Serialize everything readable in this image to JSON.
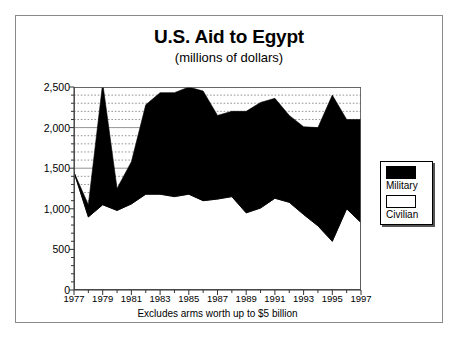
{
  "chart_data": {
    "type": "area",
    "title": "U.S. Aid to Egypt",
    "subtitle": "(millions of dollars)",
    "xlabel": "",
    "ylabel": "",
    "footnote": "Excludes arms worth up to $5 billion",
    "stacked": true,
    "grid": true,
    "legend_position": "right",
    "xlim": [
      1977,
      1997
    ],
    "ylim": [
      0,
      2500
    ],
    "ytick_values": [
      0,
      500,
      1000,
      1500,
      2000,
      2500
    ],
    "ytick_labels": [
      "0",
      "500",
      "1,000",
      "1,500",
      "2,000",
      "2,500"
    ],
    "minor_gridlines_per_interval": 5,
    "x": [
      1977,
      1978,
      1979,
      1980,
      1981,
      1982,
      1983,
      1984,
      1985,
      1986,
      1987,
      1988,
      1989,
      1990,
      1991,
      1992,
      1993,
      1994,
      1995,
      1996,
      1997
    ],
    "xtick_labels": [
      "1977",
      "1979",
      "1981",
      "1983",
      "1985",
      "1987",
      "1989",
      "1991",
      "1993",
      "1995",
      "1997"
    ],
    "xtick_values": [
      1977,
      1979,
      1981,
      1983,
      1985,
      1987,
      1989,
      1991,
      1993,
      1995,
      1997
    ],
    "series": [
      {
        "name": "Civilian",
        "color": "#ffffff",
        "values": [
          1450,
          900,
          1050,
          980,
          1060,
          1180,
          1180,
          1150,
          1180,
          1100,
          1120,
          1150,
          950,
          1010,
          1130,
          1080,
          930,
          790,
          600,
          1000,
          830
        ]
      },
      {
        "name": "Military",
        "color": "#000000",
        "values": [
          0,
          150,
          1500,
          270,
          520,
          1100,
          1250,
          1280,
          1320,
          1350,
          1030,
          1050,
          1250,
          1300,
          1230,
          1070,
          1080,
          1210,
          1800,
          1100,
          1270
        ]
      }
    ],
    "totals": [
      1450,
      1050,
      2550,
      1250,
      1580,
      2280,
      2430,
      2430,
      2500,
      2450,
      2150,
      2200,
      2200,
      2310,
      2360,
      2150,
      2010,
      2000,
      2400,
      2100,
      2100
    ]
  },
  "legend": {
    "items": [
      {
        "label": "Military",
        "swatch": "black"
      },
      {
        "label": "Civilian",
        "swatch": "white"
      }
    ]
  }
}
